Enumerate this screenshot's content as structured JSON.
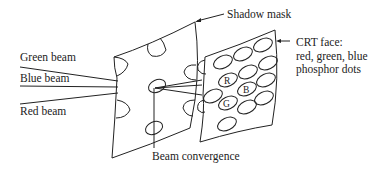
{
  "diagram": {
    "labels": {
      "green_beam": "Green beam",
      "blue_beam": "Blue beam",
      "red_beam": "Red beam",
      "shadow_mask": "Shadow mask",
      "crt_face_line1": "CRT face:",
      "crt_face_line2": "red, green, blue",
      "crt_face_line3": "phosphor dots",
      "beam_convergence": "Beam convergence"
    },
    "phosphor_dots": {
      "red": "R",
      "blue": "B",
      "green": "G"
    },
    "colors": {
      "stroke": "#222222",
      "background": "#ffffff"
    }
  }
}
